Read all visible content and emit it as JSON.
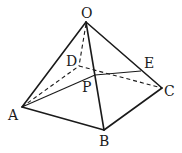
{
  "diagram": {
    "type": "pyramid",
    "labels": {
      "O": "O",
      "A": "A",
      "B": "B",
      "C": "C",
      "D": "D",
      "E": "E",
      "P": "P"
    },
    "points": {
      "O": [
        86,
        22
      ],
      "A": [
        22,
        107
      ],
      "B": [
        104,
        130
      ],
      "C": [
        162,
        88
      ],
      "D": [
        79,
        66
      ],
      "E": [
        141,
        71
      ],
      "P": [
        95,
        75
      ]
    },
    "solid_edges": [
      [
        "O",
        "A"
      ],
      [
        "O",
        "B"
      ],
      [
        "O",
        "C"
      ],
      [
        "A",
        "B"
      ],
      [
        "B",
        "C"
      ]
    ],
    "thin_edges": [
      [
        "A",
        "P"
      ],
      [
        "P",
        "E"
      ]
    ],
    "dashed_edges": [
      [
        "O",
        "D"
      ],
      [
        "A",
        "D"
      ],
      [
        "D",
        "C"
      ],
      [
        "A",
        "P"
      ]
    ]
  }
}
